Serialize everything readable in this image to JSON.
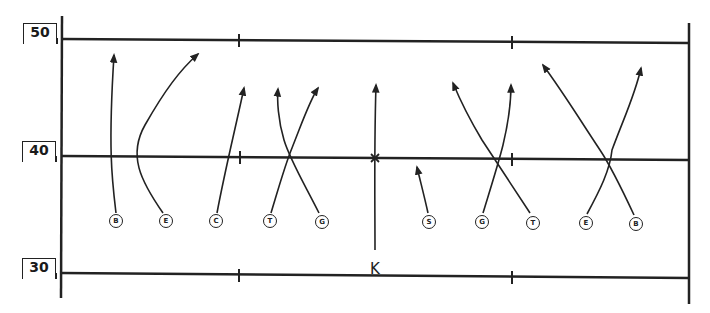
{
  "diagram": {
    "type": "football-kickoff-coverage",
    "colors": {
      "ink": "#222222",
      "background": "#ffffff"
    },
    "yard_markers": [
      {
        "label": "50",
        "y": 30
      },
      {
        "label": "40",
        "y": 146
      },
      {
        "label": "30",
        "y": 264
      }
    ],
    "players": [
      {
        "label": "B",
        "x": 116,
        "y": 221
      },
      {
        "label": "E",
        "x": 166,
        "y": 221
      },
      {
        "label": "C",
        "x": 216,
        "y": 221
      },
      {
        "label": "T",
        "x": 270,
        "y": 221
      },
      {
        "label": "G",
        "x": 322,
        "y": 222
      },
      {
        "label": "S",
        "x": 429,
        "y": 222
      },
      {
        "label": "G",
        "x": 482,
        "y": 222
      },
      {
        "label": "T",
        "x": 533,
        "y": 223
      },
      {
        "label": "E",
        "x": 586,
        "y": 223
      },
      {
        "label": "B",
        "x": 636,
        "y": 224
      }
    ],
    "kicker": {
      "label": "K",
      "x": 375,
      "y": 269
    }
  }
}
